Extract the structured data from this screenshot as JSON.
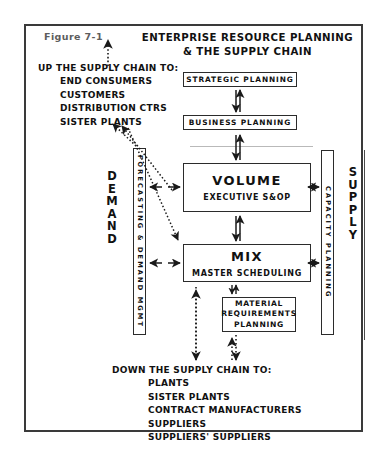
{
  "figure": {
    "label": "Figure 7-1",
    "title_line1": "ENTERPRISE RESOURCE PLANNING",
    "title_line2": "& THE SUPPLY CHAIN"
  },
  "upstream": {
    "heading": "UP THE SUPPLY CHAIN TO:",
    "items": [
      "END CONSUMERS",
      "CUSTOMERS",
      "DISTRIBUTION CTRS",
      "SISTER PLANTS"
    ]
  },
  "downstream": {
    "heading": "DOWN THE SUPPLY CHAIN TO:",
    "items": [
      "PLANTS",
      "SISTER PLANTS",
      "CONTRACT MANUFACTURERS",
      "SUPPLIERS",
      "SUPPLIERS' SUPPLIERS"
    ]
  },
  "boxes": {
    "strategic": {
      "label": "STRATEGIC PLANNING"
    },
    "business": {
      "label": "BUSINESS PLANNING"
    },
    "volume": {
      "title": "VOLUME",
      "subtitle": "EXECUTIVE S&OP"
    },
    "mix": {
      "title": "MIX",
      "subtitle": "MASTER SCHEDULING"
    },
    "mrp": {
      "line1": "MATERIAL",
      "line2": "REQUIREMENTS",
      "line3": "PLANNING"
    }
  },
  "side_columns": {
    "left_box": "FORECASTING & DEMAND MGMT",
    "right_box": "CAPACITY PLANNING",
    "left_word": "DEMAND",
    "right_word": "SUPPLY"
  },
  "colors": {
    "frame": "#3a3a3a",
    "box_border": "#2b2b2b",
    "text": "#111111",
    "figure_label": "#5d5d5d",
    "arrow": "#1a1a1a"
  }
}
